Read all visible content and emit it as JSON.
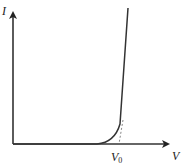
{
  "diagram": {
    "type": "diode I-V characteristic",
    "axes": {
      "y_label": "I",
      "x_label": "V"
    },
    "threshold": {
      "label_main": "V",
      "label_sub": "0"
    },
    "colors": {
      "axis": "#333333",
      "curve": "#333333",
      "dashed": "#777777",
      "background": "#ffffff"
    }
  }
}
